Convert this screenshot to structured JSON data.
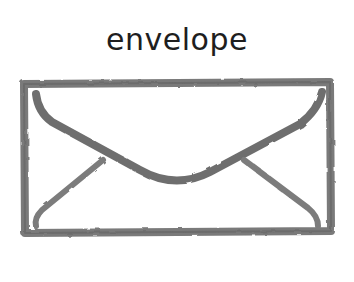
{
  "caption": {
    "text": "envelope"
  },
  "illustration": {
    "subject": "envelope-icon",
    "style": "watercolor sketch",
    "stroke_color": "#6f6f6f",
    "stroke_dark": "#555555",
    "background": "#ffffff"
  }
}
